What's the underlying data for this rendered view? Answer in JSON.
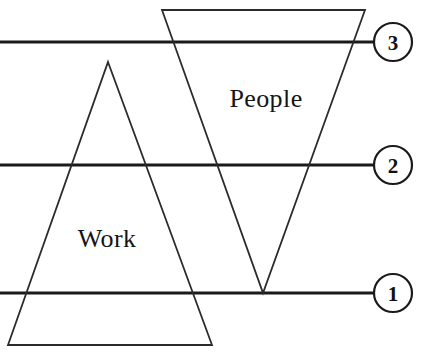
{
  "diagram": {
    "background_color": "#ffffff",
    "line_color": "#1a1a1a",
    "shape_stroke_color": "#2b2b2b",
    "labels": {
      "work": "Work",
      "people": "People"
    },
    "levels": [
      {
        "number": "3",
        "line_y": 42,
        "circle_cx": 393,
        "circle_cy": 42,
        "line_x1": 0,
        "line_x2": 374
      },
      {
        "number": "2",
        "line_y": 165,
        "circle_cx": 393,
        "circle_cy": 165,
        "line_x1": 0,
        "line_x2": 374
      },
      {
        "number": "1",
        "line_y": 293,
        "circle_cx": 393,
        "circle_cy": 293,
        "line_x1": 0,
        "line_x2": 374
      }
    ],
    "shapes": {
      "work_triangle": {
        "name": "Work",
        "orientation": "upright",
        "points": "108,62 212,345 8,345"
      },
      "people_triangle": {
        "name": "People",
        "orientation": "inverted",
        "points": "162,10 365,10 263,293"
      }
    },
    "label_positions": {
      "work": {
        "x": 107,
        "y": 238
      },
      "people": {
        "x": 266,
        "y": 98
      }
    },
    "circle_radius": 19
  }
}
